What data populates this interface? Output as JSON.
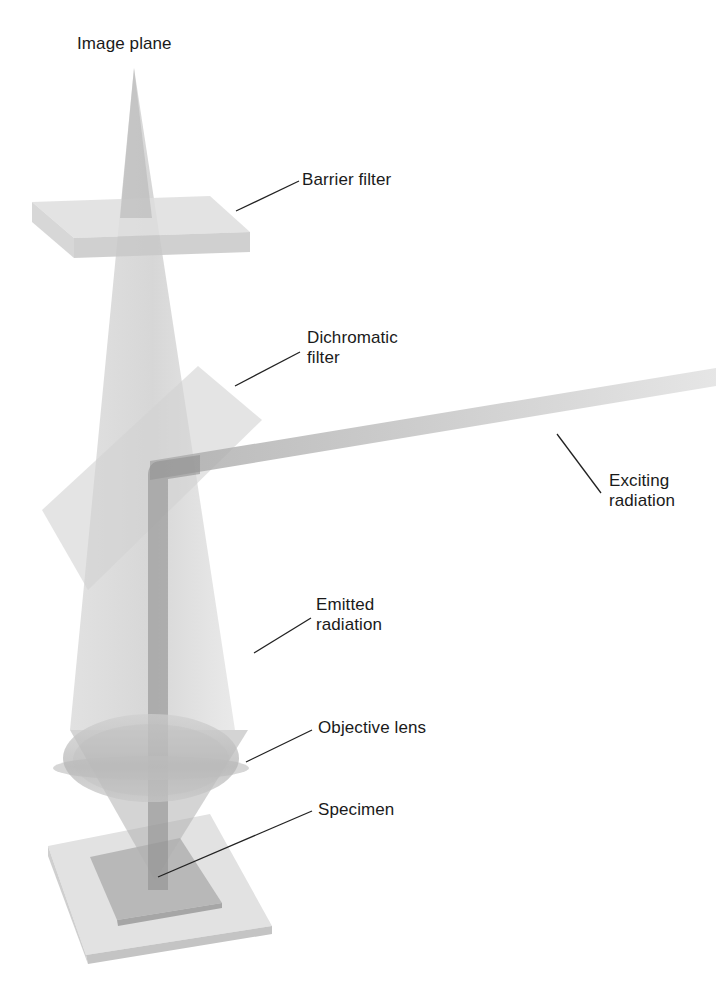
{
  "diagram": {
    "type": "fluorescence-microscope-optical-path",
    "colors": {
      "background": "#ffffff",
      "light_cone": "#bdbdbd",
      "filter_glass": "#d6d6d6",
      "beam": "#8f8f8f",
      "leader_line": "#222222",
      "text": "#1a1a1a"
    },
    "labels": {
      "image_plane": "Image plane",
      "barrier_filter": "Barrier filter",
      "dichromatic_filter": "Dichromatic\nfilter",
      "exciting_radiation": "Exciting\nradiation",
      "emitted_radiation": "Emitted\nradiation",
      "objective_lens": "Objective lens",
      "specimen": "Specimen"
    }
  }
}
